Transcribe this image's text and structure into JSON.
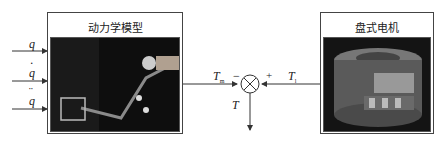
{
  "blocks": {
    "dynamics": {
      "title": "动力学模型",
      "image": "robot-arm-photo"
    },
    "motor": {
      "title": "盘式电机",
      "image": "disc-motor-photo"
    }
  },
  "inputs": [
    {
      "label": "q",
      "accent": ""
    },
    {
      "label": "q",
      "accent": "·"
    },
    {
      "label": "q",
      "accent": "¨"
    }
  ],
  "signals": {
    "tm_main": "T",
    "tm_sub": "m",
    "tl_main": "T",
    "tl_sub": "l",
    "minus": "−",
    "plus": "+",
    "output": "T"
  },
  "colors": {
    "line": "#333333",
    "photo_bg": "#141414"
  }
}
